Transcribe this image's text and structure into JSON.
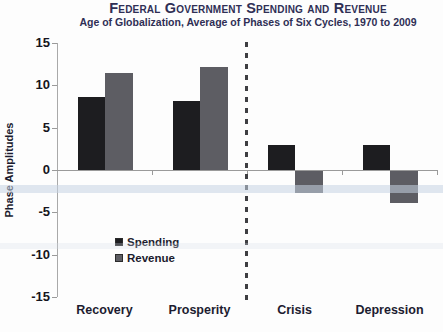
{
  "title": "Federal Government Spending and Revenue",
  "subtitle": "Age of Globalization, Average of Phases of Six Cycles, 1970 to 2009",
  "chart_data": {
    "type": "bar",
    "categories": [
      "Recovery",
      "Prosperity",
      "Crisis",
      "Depression"
    ],
    "series": [
      {
        "name": "Spending",
        "color": "#1d1d20",
        "values": [
          8.6,
          8.1,
          2.9,
          2.9
        ]
      },
      {
        "name": "Revenue",
        "color": "#5d5d63",
        "values": [
          11.4,
          12.2,
          -2.6,
          -3.8
        ]
      }
    ],
    "xlabel": "",
    "ylabel": "Phase Amplitudes",
    "ylim": [
      -15,
      15
    ],
    "yticks": [
      15,
      10,
      5,
      0,
      -5,
      -10,
      -15
    ],
    "grid": false,
    "legend_position": "inside-bottom-left",
    "divider_after_category": "Prosperity"
  },
  "colors": {
    "title_text": "#2f2f55",
    "axis_line": "#9a9a9a",
    "tick_text": "#151520",
    "category_text": "#1c1c30",
    "divider": "#3e3e42",
    "scan_band": "#c7d4e4",
    "background": "#fdfdfd"
  }
}
